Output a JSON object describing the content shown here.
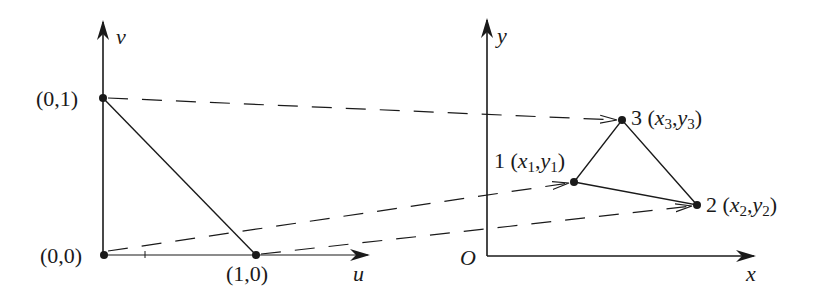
{
  "diagram": {
    "colors": {
      "ink": "#1a1a1a",
      "background": "#ffffff"
    },
    "reference_plane": {
      "horizontal_axis_label": "u",
      "vertical_axis_label": "v",
      "points": [
        {
          "id": "p01",
          "label": "(0,1)"
        },
        {
          "id": "p00",
          "label": "(0,0)"
        },
        {
          "id": "p10",
          "label": "(1,0)"
        }
      ]
    },
    "physical_plane": {
      "horizontal_axis_label": "x",
      "vertical_axis_label": "y",
      "origin_label": "O",
      "nodes": [
        {
          "id": "1",
          "number": "1",
          "x": "x",
          "y": "y",
          "sub": "1"
        },
        {
          "id": "2",
          "number": "2",
          "x": "x",
          "y": "y",
          "sub": "2"
        },
        {
          "id": "3",
          "number": "3",
          "x": "x",
          "y": "y",
          "sub": "3"
        }
      ]
    },
    "mappings": [
      {
        "from": "(0,1)",
        "to": "3"
      },
      {
        "from": "(0,0)",
        "to": "1"
      },
      {
        "from": "(1,0)",
        "to": "2"
      }
    ]
  }
}
